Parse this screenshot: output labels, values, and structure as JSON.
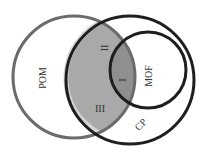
{
  "diagram": {
    "type": "venn",
    "sets": [
      {
        "id": "POM",
        "label": "POM",
        "stroke": "#6b6b6b"
      },
      {
        "id": "CP",
        "label": "CP",
        "stroke": "#1e1e1e"
      },
      {
        "id": "MOF",
        "label": "MOF",
        "stroke": "#1e1e1e"
      }
    ],
    "regions": [
      {
        "id": "I",
        "label": "I",
        "description": "POM ∩ CP ∩ MOF",
        "fill": "#8f8f8f"
      },
      {
        "id": "II",
        "label": "II",
        "description": "POM ∩ CP (outside MOF)",
        "fill": "#a9a9a9"
      },
      {
        "id": "III",
        "label": "III",
        "description": "CP region inside POM area",
        "fill": "#ffffff"
      }
    ]
  },
  "labels": {
    "pom": "POM",
    "cp": "CP",
    "mof": "MOF",
    "region_1": "I",
    "region_2": "II",
    "region_3": "III"
  }
}
